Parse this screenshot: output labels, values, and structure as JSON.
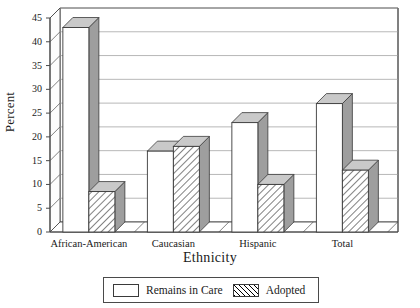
{
  "chart_data": {
    "type": "bar",
    "title": "",
    "xlabel": "Ethnicity",
    "ylabel": "Percent",
    "categories": [
      "African-American",
      "Caucasian",
      "Hispanic",
      "Total"
    ],
    "series": [
      {
        "name": "Remains in Care",
        "values": [
          43,
          17,
          23,
          27
        ],
        "style": "solid-white"
      },
      {
        "name": "Adopted",
        "values": [
          8.5,
          18,
          10,
          13
        ],
        "style": "diagonal-hatch"
      }
    ],
    "ylim": [
      0,
      45
    ],
    "yticks": [
      0,
      5,
      10,
      15,
      20,
      25,
      30,
      35,
      40,
      45
    ],
    "ytick_labels": [
      "0",
      "5",
      "10",
      "15",
      "20",
      "25",
      "30",
      "35",
      "40",
      "45"
    ],
    "grid": true,
    "grid_axis": "y",
    "legend_position": "bottom",
    "three_d": true
  },
  "legend": {
    "entries": [
      {
        "label": "Remains in Care",
        "swatch": "empty-white-swatch"
      },
      {
        "label": "Adopted",
        "swatch": "diagonal-hatch-swatch"
      }
    ]
  },
  "colors": {
    "axis": "#4a4a4a",
    "grid": "#9a9a9a",
    "bar_face": "#ffffff",
    "bar_side": "#9e9e9e",
    "bar_top": "#c9c9c9",
    "bar_edge": "#3a3a3a",
    "text": "#1a1a1a",
    "floor": "#e8e8e8"
  }
}
